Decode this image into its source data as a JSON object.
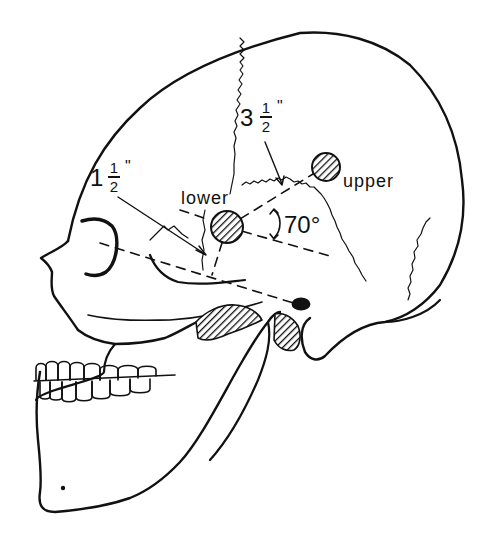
{
  "figure": {
    "line_color": "#111111",
    "background": "#ffffff"
  },
  "labels": {
    "lower": "lower",
    "upper": "upper",
    "angle": "70°",
    "upper_distance": {
      "whole": "3",
      "numerator": "1",
      "denominator": "2",
      "unit": "\""
    },
    "lower_distance": {
      "whole": "1",
      "numerator": "1",
      "denominator": "2",
      "unit": "\""
    }
  },
  "markers": [
    {
      "name": "lower",
      "cx": 227,
      "cy": 227,
      "r": 16
    },
    {
      "name": "upper",
      "cx": 326,
      "cy": 167,
      "r": 14
    }
  ]
}
